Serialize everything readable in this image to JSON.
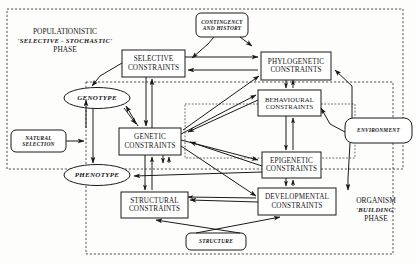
{
  "diagram": {
    "phases": [
      {
        "id": "populationistic",
        "line1": "POPULATIONISTIC",
        "line2": "'SELECTIVE -  STOCHASTIC'",
        "line3": "PHASE"
      },
      {
        "id": "organism",
        "line1": "ORGANISM",
        "line2": "'BUILDING'",
        "line3": "PHASE"
      }
    ],
    "nodes": {
      "contingency": {
        "line1": "CONTINGENCY",
        "line2": "AND HISTORY",
        "shape": "rounded"
      },
      "selective": {
        "line1": "SELECTIVE",
        "line2": "CONSTRAINTS",
        "shape": "rect"
      },
      "phylogenetic": {
        "line1": "PHYLOGENETIC",
        "line2": "CONSTRAINTS",
        "shape": "rect"
      },
      "behavioural": {
        "line1": "BEHAVIOURAL",
        "line2": "CONSTRAINTS",
        "shape": "rect"
      },
      "epigenetic": {
        "line1": "EPIGENETIC",
        "line2": "CONSTRAINTS",
        "shape": "rect"
      },
      "developmental": {
        "line1": "DEVELOPMENTAL",
        "line2": "CONSTRAINTS",
        "shape": "rect"
      },
      "genetic": {
        "line1": "GENETIC",
        "line2": "CONSTRAINTS",
        "shape": "rect"
      },
      "structural": {
        "line1": "STRUCTURAL",
        "line2": "CONSTRAINTS",
        "shape": "rect"
      },
      "genotype": {
        "line1": "GENOTYPE",
        "shape": "ellipse"
      },
      "phenotype": {
        "line1": "PHENOTYPE",
        "shape": "ellipse"
      },
      "natural_selection": {
        "line1": "NATURAL",
        "line2": "SELECTION",
        "shape": "rounded"
      },
      "environment": {
        "line1": "ENVIRONMENT",
        "shape": "rounded"
      },
      "structure": {
        "line1": "STRUCTURE",
        "shape": "rounded"
      }
    },
    "colors": {
      "stroke": "#1a1a1a",
      "background": "#fdfdfc",
      "text": "#151515"
    }
  }
}
